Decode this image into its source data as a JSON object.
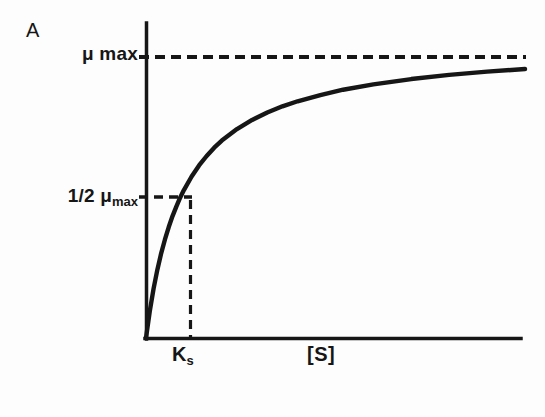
{
  "figure": {
    "panel_letter": "A",
    "background_color": "#fdfdfd",
    "ink_color": "#161616"
  },
  "labels": {
    "y_tick_top": "μ max",
    "y_tick_half_main": "1/2 μ",
    "y_tick_half_sub": "max",
    "x_tick_ks_main": "K",
    "x_tick_ks_sub": "s",
    "x_axis_label": "[S]"
  },
  "chart_data": {
    "type": "line",
    "title": "A",
    "xlabel": "[S]",
    "ylabel": "",
    "grid": false,
    "legend": null,
    "curve_name": "Monod saturation curve",
    "equation": "μ = μ max · [S] / (Ks + [S])",
    "xlim": [
      0,
      10
    ],
    "ylim": [
      0,
      1.1
    ],
    "x_ticks": [
      {
        "value": 1.0,
        "label": "K s"
      }
    ],
    "y_ticks": [
      {
        "value": 1.0,
        "label": "μ max"
      },
      {
        "value": 0.5,
        "label": "1/2 μ max"
      }
    ],
    "annotations": [
      {
        "kind": "horizontal-dashed-asymptote",
        "y": 1.0,
        "label": "μ max",
        "x_from": 0,
        "x_to": 10.2
      },
      {
        "kind": "horizontal-dashed-guide",
        "y": 0.5,
        "label": "1/2 μ max",
        "x_from": 0,
        "x_to": 1.0
      },
      {
        "kind": "vertical-dashed-guide",
        "x": 1.0,
        "label": "K s",
        "y_from": 0,
        "y_to": 0.5
      }
    ],
    "x": [
      0.0,
      0.1,
      0.2,
      0.3,
      0.4,
      0.5,
      0.6,
      0.7,
      0.8,
      0.9,
      1.0,
      1.2,
      1.4,
      1.6,
      1.8,
      2.0,
      2.4,
      2.8,
      3.2,
      3.6,
      4.0,
      4.6,
      5.2,
      6.0,
      7.0,
      8.0,
      9.0,
      10.0
    ],
    "y": [
      0.0,
      0.091,
      0.167,
      0.231,
      0.286,
      0.333,
      0.375,
      0.412,
      0.444,
      0.474,
      0.5,
      0.545,
      0.583,
      0.615,
      0.643,
      0.667,
      0.706,
      0.737,
      0.762,
      0.783,
      0.8,
      0.821,
      0.839,
      0.857,
      0.875,
      0.889,
      0.9,
      0.909
    ],
    "series": [
      {
        "name": "μ vs [S]",
        "style": "solid",
        "line_width_px": 4,
        "color": "#161616"
      }
    ]
  },
  "geometry": {
    "origin": {
      "x": 146,
      "y": 338
    },
    "y_axis_top": 23,
    "x_axis_right": 520,
    "mumax_line_y": 57,
    "half_mumax_y": 197,
    "ks_x": 190,
    "plateau_y": 69,
    "dash_pattern": "9 5"
  }
}
